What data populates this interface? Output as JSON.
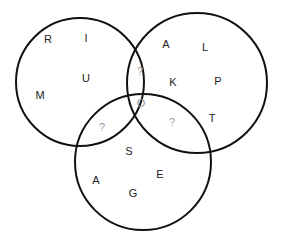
{
  "diagram": {
    "type": "venn",
    "sets": [
      {
        "id": "left",
        "name": "set-left",
        "only_letters": [
          "R",
          "I",
          "U",
          "M"
        ]
      },
      {
        "id": "right",
        "name": "set-right",
        "only_letters": [
          "A",
          "L",
          "K",
          "P",
          "T"
        ]
      },
      {
        "id": "bottom",
        "name": "set-bottom",
        "only_letters": [
          "S",
          "A",
          "E",
          "G"
        ]
      }
    ],
    "intersections": {
      "left_right": "?",
      "left_bottom": "?",
      "right_bottom": "?",
      "all_three": "O"
    },
    "colors": {
      "outline": "#111111",
      "letter": "#222222",
      "unknown": "#9a9a9a"
    }
  }
}
